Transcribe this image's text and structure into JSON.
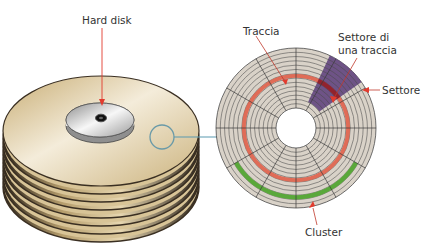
{
  "labels": {
    "hard_disk": "Hard disk",
    "track": "Traccia",
    "track_sector_line1": "Settore di",
    "track_sector_line2": "una traccia",
    "sector": "Settore",
    "cluster": "Cluster"
  },
  "colors": {
    "platter_light": "#f3ead6",
    "platter_dark": "#c9b07a",
    "platter_edge": "#3a2f22",
    "spindle_light": "#f2f2f2",
    "spindle_dark": "#9a9a9a",
    "disk_surface": "#d9d2c8",
    "track_lines": "#4a4a4a",
    "track_highlight": "#e0604a",
    "sector_highlight": "#5b3d7a",
    "cluster_highlight": "#5aa83a",
    "pointer_red": "#e23b2e",
    "zoom_circle": "#6a9aa8"
  },
  "disk_geometry": {
    "tracks": 14,
    "sectors": 12,
    "highlighted_track_index": 8,
    "highlighted_sector_start_deg": -65,
    "highlighted_sector_end_deg": -35,
    "cluster_track_index": 2,
    "cluster_start_deg": 30,
    "cluster_end_deg": 150
  }
}
